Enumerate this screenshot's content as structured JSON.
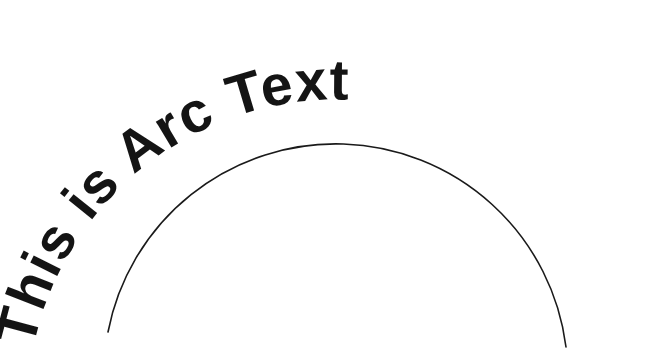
{
  "canvas": {
    "width": 670,
    "height": 359,
    "background_color": "#ffffff"
  },
  "artwork": {
    "type": "arc-text",
    "title": "This is Arc Text",
    "text": "This is Arc Text",
    "text_color": "#141414",
    "font_weight": "bold",
    "font_size_px": 57,
    "letters": [
      "T",
      "h",
      "i",
      "s",
      " ",
      "i",
      "s",
      " ",
      "A",
      "r",
      "c",
      " ",
      "T",
      "e",
      "x",
      "t"
    ],
    "baseline_shift": -8
  },
  "guide_arc": {
    "name": "arc-guide-line",
    "stroke_color": "#1a1a1a",
    "stroke_width_px": 1.6,
    "start_point": {
      "x": 108,
      "y": 332
    },
    "apex_point": {
      "x": 337,
      "y": 97
    },
    "end_point": {
      "x": 566,
      "y": 347
    },
    "radius_px": 232,
    "center": {
      "x": 337,
      "y": 329
    },
    "path": "M 108 332 A 232 232 0 0 1 566 347"
  },
  "text_arc": {
    "name": "text-baseline-arc",
    "radius_px": 302,
    "center": {
      "x": 337,
      "y": 330
    },
    "path": "M 38 367 A 302 302 0 0 1 636 367",
    "start_offset_percent": "2%"
  }
}
